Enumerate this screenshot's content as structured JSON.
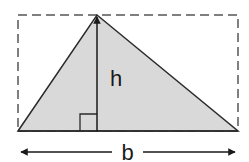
{
  "diagram": {
    "labels": {
      "height": "h",
      "base": "b"
    },
    "colors": {
      "triangle_fill": "#d9d9d9",
      "stroke": "#2a2a2a",
      "dashed_rect": "#555555",
      "background": "#ffffff"
    },
    "shapes": {
      "bounding_rectangle": {
        "x": 18,
        "y": 15,
        "width": 220,
        "height": 116,
        "style": "dashed"
      },
      "triangle": {
        "points": [
          [
            18,
            131
          ],
          [
            97,
            15
          ],
          [
            238,
            131
          ]
        ]
      },
      "height_line": {
        "x": 97,
        "y_from": 131,
        "y_to": 15,
        "arrowhead": "top"
      },
      "right_angle_marker": {
        "x": 80,
        "y": 114,
        "size": 17
      },
      "base_dimension_arrow": {
        "y": 152,
        "x_from": 20,
        "x_to": 236,
        "arrowheads": "both"
      }
    }
  }
}
